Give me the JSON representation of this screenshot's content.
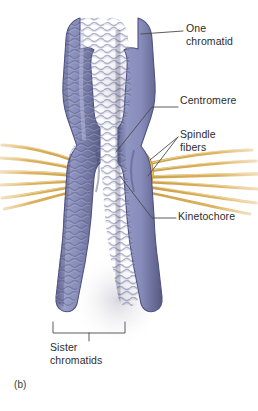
{
  "figure": {
    "panel_label": "(b)",
    "background_color": "#ffffff"
  },
  "labels": {
    "one_chromatid": "One\nchromatid",
    "centromere": "Centromere",
    "spindle_fibers": "Spindle\nfibers",
    "kinetochore": "Kinetochore",
    "sister_chromatids": "Sister\nchromatids"
  },
  "colors": {
    "chromatid_fill": "#8287b4",
    "chromatid_fill_dark": "#5f6394",
    "chromatid_fill_light": "#a2a6ca",
    "chromatid_outline": "#5b5f8f",
    "kinetochore_orange": "#e8962c",
    "kinetochore_orange_light": "#f6bd5f",
    "spindle_fiber": "#d9ac54",
    "spindle_fiber_light": "#f0d292",
    "leader_line": "#4a4a4a",
    "text": "#2c2c2c",
    "shadow": "#d7d7de"
  },
  "structures": {
    "chromatid_count": 2,
    "kinetochore_count": 2,
    "spindle_fiber_count_left": 6,
    "spindle_fiber_count_right": 6
  }
}
